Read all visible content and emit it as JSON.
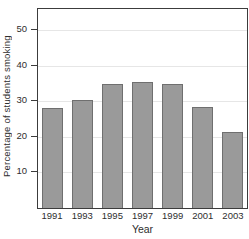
{
  "chart_data": {
    "type": "bar",
    "title": "",
    "categories": [
      "1991",
      "1993",
      "1995",
      "1997",
      "1999",
      "2001",
      "2003"
    ],
    "values": [
      28,
      30.5,
      35,
      35.5,
      35,
      28.5,
      21.5
    ],
    "xlabel": "Year",
    "ylabel": "Percentage of students smoking",
    "yticks": [
      10,
      20,
      30,
      40,
      50
    ],
    "ylim": [
      0,
      56
    ],
    "grid": true,
    "legend": false,
    "colors": {
      "bar_fill": "#9a9a9a",
      "bar_border": "#6f6f6f",
      "gridline": "#e6e6e6",
      "frame": "#3c3c3c",
      "text": "#2e2e2e",
      "background": "#ffffff"
    }
  }
}
